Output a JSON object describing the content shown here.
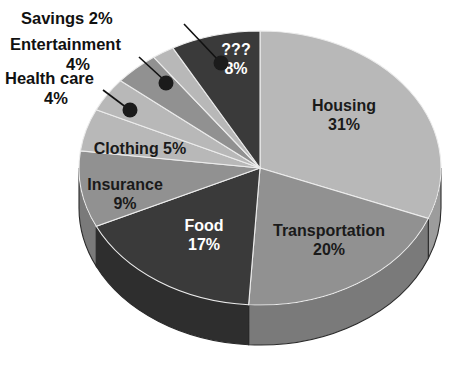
{
  "chart_data": {
    "type": "pie",
    "title": "",
    "subtitle": "",
    "xlabel": "",
    "ylabel": "",
    "legend_position": "none",
    "grid": false,
    "style": "3d-exploded-none",
    "total_percent": 100,
    "categories": [
      "Housing",
      "Transportation",
      "Food",
      "Insurance",
      "Clothing",
      "Health care",
      "Entertainment",
      "Savings",
      "???"
    ],
    "values": [
      31,
      20,
      17,
      9,
      5,
      4,
      4,
      2,
      8
    ],
    "labels": [
      "Housing 31%",
      "Transportation 20%",
      "Food 17%",
      "Insurance 9%",
      "Clothing 5%",
      "Health care 4%",
      "Entertainment 4%",
      "Savings 2%",
      "??? 8%"
    ],
    "slices": [
      {
        "name": "Housing",
        "value": 31,
        "value_text": "31%",
        "label_line1": "Housing",
        "label_line2": "31%",
        "label_placement": "inside",
        "text_tone": "dark",
        "color": "#b8b8b8",
        "side_color": "#9c9c9c"
      },
      {
        "name": "Transportation",
        "value": 20,
        "value_text": "20%",
        "label_line1": "Transportation",
        "label_line2": "20%",
        "label_placement": "inside",
        "text_tone": "dark",
        "color": "#919191",
        "side_color": "#7a7a7a"
      },
      {
        "name": "Food",
        "value": 17,
        "value_text": "17%",
        "label_line1": "Food",
        "label_line2": "17%",
        "label_placement": "inside",
        "text_tone": "light",
        "color": "#3a3a3a",
        "side_color": "#2e2e2e"
      },
      {
        "name": "Insurance",
        "value": 9,
        "value_text": "9%",
        "label_line1": "Insurance",
        "label_line2": "9%",
        "label_placement": "inside",
        "text_tone": "dark",
        "color": "#919191",
        "side_color": "#7a7a7a"
      },
      {
        "name": "Clothing",
        "value": 5,
        "value_text": "5%",
        "label_line1": "Clothing 5%",
        "label_line2": "",
        "label_placement": "inside",
        "text_tone": "dark",
        "color": "#b8b8b8",
        "side_color": "#9c9c9c"
      },
      {
        "name": "Health care",
        "value": 4,
        "value_text": "4%",
        "label_line1": "Health care",
        "label_line2": "4%",
        "label_placement": "callout",
        "text_tone": "dark",
        "color": "#b8b8b8",
        "side_color": "#9c9c9c"
      },
      {
        "name": "Entertainment",
        "value": 4,
        "value_text": "4%",
        "label_line1": "Entertainment",
        "label_line2": "4%",
        "label_placement": "callout",
        "text_tone": "dark",
        "color": "#919191",
        "side_color": "#7a7a7a"
      },
      {
        "name": "Savings",
        "value": 2,
        "value_text": "2%",
        "label_line1": "Savings 2%",
        "label_line2": "",
        "label_placement": "callout",
        "text_tone": "dark",
        "color": "#b8b8b8",
        "side_color": "#9c9c9c"
      },
      {
        "name": "???",
        "value": 8,
        "value_text": "8%",
        "label_line1": "???",
        "label_line2": "8%",
        "label_placement": "inside",
        "text_tone": "light",
        "color": "#3a3a3a",
        "side_color": "#2e2e2e"
      }
    ],
    "colors": {
      "light_gray": "#b8b8b8",
      "medium_gray": "#919191",
      "dark_gray": "#3a3a3a",
      "background": "#ffffff",
      "label_dark": "#1a1a1a",
      "label_light": "#ffffff",
      "leader_line": "#111111"
    }
  },
  "callouts": [
    {
      "name": "savings",
      "line1": "Savings 2%",
      "line2": ""
    },
    {
      "name": "entertainment",
      "line1": "Entertainment",
      "line2": "4%"
    },
    {
      "name": "health-care",
      "line1": "Health care",
      "line2": "4%"
    }
  ]
}
